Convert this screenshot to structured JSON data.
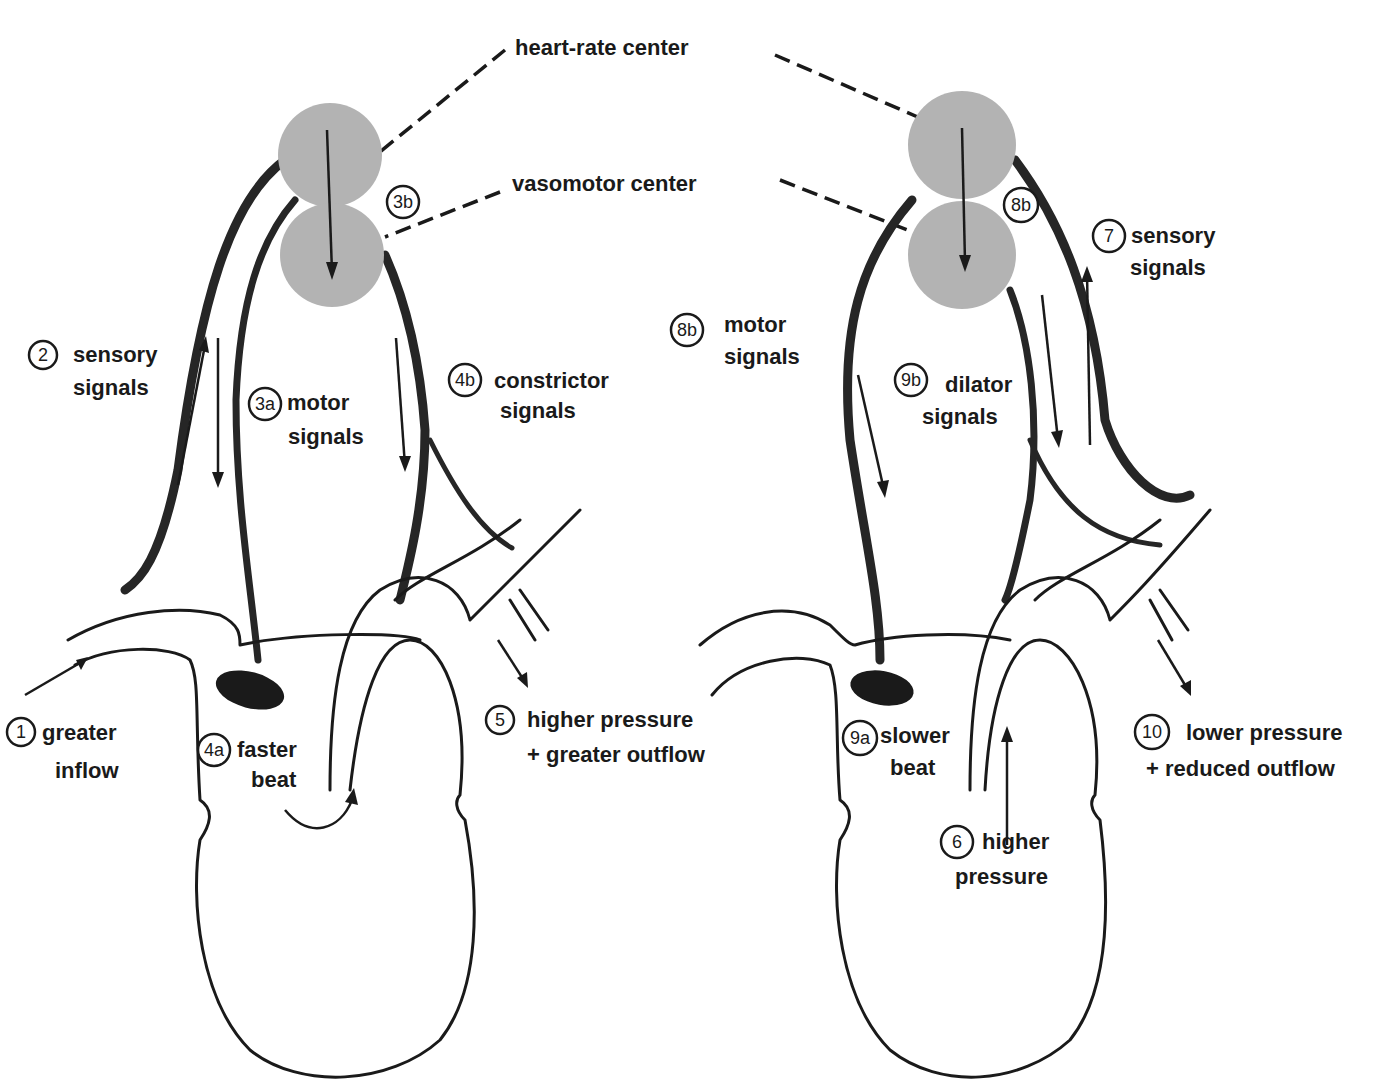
{
  "title_labels": {
    "heart_rate_center": "heart-rate center",
    "vasomotor_center": "vasomotor center"
  },
  "left_panel": {
    "steps": [
      {
        "badge": "1",
        "line1": "greater",
        "line2": "inflow"
      },
      {
        "badge": "2",
        "line1": "sensory",
        "line2": "signals"
      },
      {
        "badge": "3a",
        "line1": "motor",
        "line2": "signals"
      },
      {
        "badge": "3b",
        "line1": "",
        "line2": ""
      },
      {
        "badge": "4a",
        "line1": "faster",
        "line2": "beat"
      },
      {
        "badge": "4b",
        "line1": "constrictor",
        "line2": "signals"
      },
      {
        "badge": "5",
        "line1": "higher pressure",
        "line2": "+ greater outflow"
      }
    ]
  },
  "right_panel": {
    "steps": [
      {
        "badge": "6",
        "line1": "higher",
        "line2": "pressure"
      },
      {
        "badge": "7",
        "line1": "sensory",
        "line2": "signals"
      },
      {
        "badge": "8b",
        "line1": "",
        "line2": ""
      },
      {
        "badge": "8b",
        "line1": "motor",
        "line2": "signals"
      },
      {
        "badge": "9a",
        "line1": "slower",
        "line2": "beat"
      },
      {
        "badge": "9b",
        "line1": "dilator",
        "line2": "signals"
      },
      {
        "badge": "10",
        "line1": "lower pressure",
        "line2": "+ reduced outflow"
      }
    ]
  },
  "colors": {
    "ink": "#1a1a1a",
    "center_fill": "#b3b3b3",
    "background": "#ffffff"
  }
}
